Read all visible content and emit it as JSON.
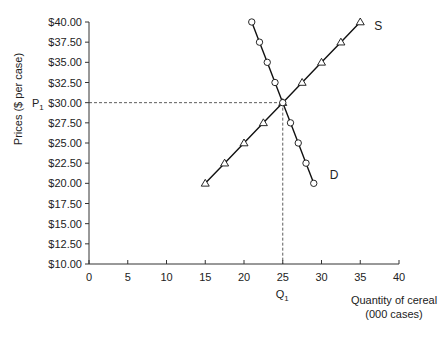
{
  "chart_data": {
    "type": "line",
    "title": "",
    "xlabel": "Quantity of cereal (000 cases)",
    "xlabel_lines": [
      "Quantity of cereal",
      "(000 cases)"
    ],
    "ylabel": "Prices ($ per case)",
    "xlim": [
      0,
      40
    ],
    "ylim": [
      10,
      40
    ],
    "x_ticks": [
      0,
      5,
      10,
      15,
      20,
      25,
      30,
      35,
      40
    ],
    "x_tick_labels": [
      "0",
      "5",
      "10",
      "15",
      "20",
      "25",
      "30",
      "35",
      "40"
    ],
    "y_ticks": [
      10,
      12.5,
      15,
      17.5,
      20,
      22.5,
      25,
      27.5,
      30,
      32.5,
      35,
      37.5,
      40
    ],
    "y_tick_labels": [
      "$10.00",
      "$12.50",
      "$15.00",
      "$17.50",
      "$20.00",
      "$22.50",
      "$25.00",
      "$27.50",
      "$30.00",
      "$32.50",
      "$35.00",
      "$37.50",
      "$40.00"
    ],
    "grid": false,
    "legend": "none",
    "series": [
      {
        "name": "S",
        "marker": "triangle",
        "x": [
          15,
          17.5,
          20,
          22.5,
          25,
          27.5,
          30,
          32.5,
          35
        ],
        "y": [
          20,
          22.5,
          25,
          27.5,
          30,
          32.5,
          35,
          37.5,
          40
        ]
      },
      {
        "name": "D",
        "marker": "circle",
        "x": [
          21,
          22,
          23,
          24,
          25,
          26,
          27,
          28,
          29
        ],
        "y": [
          40,
          37.5,
          35,
          32.5,
          30,
          27.5,
          25,
          22.5,
          20
        ]
      }
    ],
    "annotations": [
      {
        "text": "P",
        "subscript": "1",
        "axis": "y",
        "value": 30
      },
      {
        "text": "Q",
        "subscript": "1",
        "axis": "x",
        "value": 25
      }
    ],
    "equilibrium": {
      "x": 25,
      "y": 30,
      "guide_lines": "dashed"
    }
  }
}
